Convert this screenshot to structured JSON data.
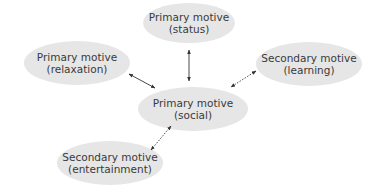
{
  "diagram": {
    "colors": {
      "node_fill": "#e6e6e6",
      "text": "#3a3a3a",
      "arrow": "#333333"
    },
    "nodes": [
      {
        "id": "status",
        "line1": "Primary motive",
        "line2": "(status)",
        "cx": 189,
        "cy": 23,
        "rx": 46,
        "ry": 20
      },
      {
        "id": "relaxation",
        "line1": "Primary motive",
        "line2": "(relaxation)",
        "cx": 77,
        "cy": 63,
        "rx": 53,
        "ry": 22
      },
      {
        "id": "learning",
        "line1": "Secondary motive",
        "line2": "(learning)",
        "cx": 309,
        "cy": 64,
        "rx": 53,
        "ry": 22
      },
      {
        "id": "social",
        "line1": "Primary motive",
        "line2": "(social)",
        "cx": 193,
        "cy": 109,
        "rx": 55,
        "ry": 22
      },
      {
        "id": "entertainment",
        "line1": "Secondary motive",
        "line2": "(entertainment)",
        "cx": 110,
        "cy": 163,
        "rx": 53,
        "ry": 22
      }
    ],
    "edges": [
      {
        "from": "status",
        "to": "social",
        "style": "solid",
        "bidirectional": true
      },
      {
        "from": "relaxation",
        "to": "social",
        "style": "solid",
        "bidirectional": true
      },
      {
        "from": "learning",
        "to": "social",
        "style": "dotted",
        "bidirectional": true
      },
      {
        "from": "entertainment",
        "to": "social",
        "style": "dotted",
        "bidirectional": true
      }
    ]
  }
}
